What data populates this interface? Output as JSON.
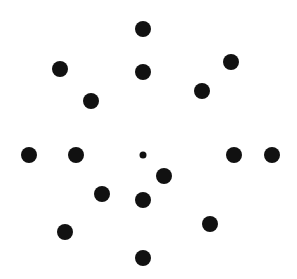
{
  "figure": {
    "width": 297,
    "height": 279,
    "background": "#ffffff",
    "dot_color": "#111111",
    "dots": [
      {
        "cx": 143,
        "cy": 29,
        "r": 8
      },
      {
        "cx": 60,
        "cy": 69,
        "r": 8
      },
      {
        "cx": 143,
        "cy": 72,
        "r": 8
      },
      {
        "cx": 231,
        "cy": 62,
        "r": 8
      },
      {
        "cx": 91,
        "cy": 101,
        "r": 8
      },
      {
        "cx": 202,
        "cy": 91,
        "r": 8
      },
      {
        "cx": 29,
        "cy": 155,
        "r": 8
      },
      {
        "cx": 76,
        "cy": 155,
        "r": 8
      },
      {
        "cx": 143,
        "cy": 155,
        "r": 3.5
      },
      {
        "cx": 234,
        "cy": 155,
        "r": 8
      },
      {
        "cx": 272,
        "cy": 155,
        "r": 8
      },
      {
        "cx": 164,
        "cy": 176,
        "r": 8
      },
      {
        "cx": 102,
        "cy": 194,
        "r": 8
      },
      {
        "cx": 143,
        "cy": 200,
        "r": 8
      },
      {
        "cx": 210,
        "cy": 224,
        "r": 8
      },
      {
        "cx": 65,
        "cy": 232,
        "r": 8
      },
      {
        "cx": 143,
        "cy": 258,
        "r": 8
      }
    ]
  }
}
